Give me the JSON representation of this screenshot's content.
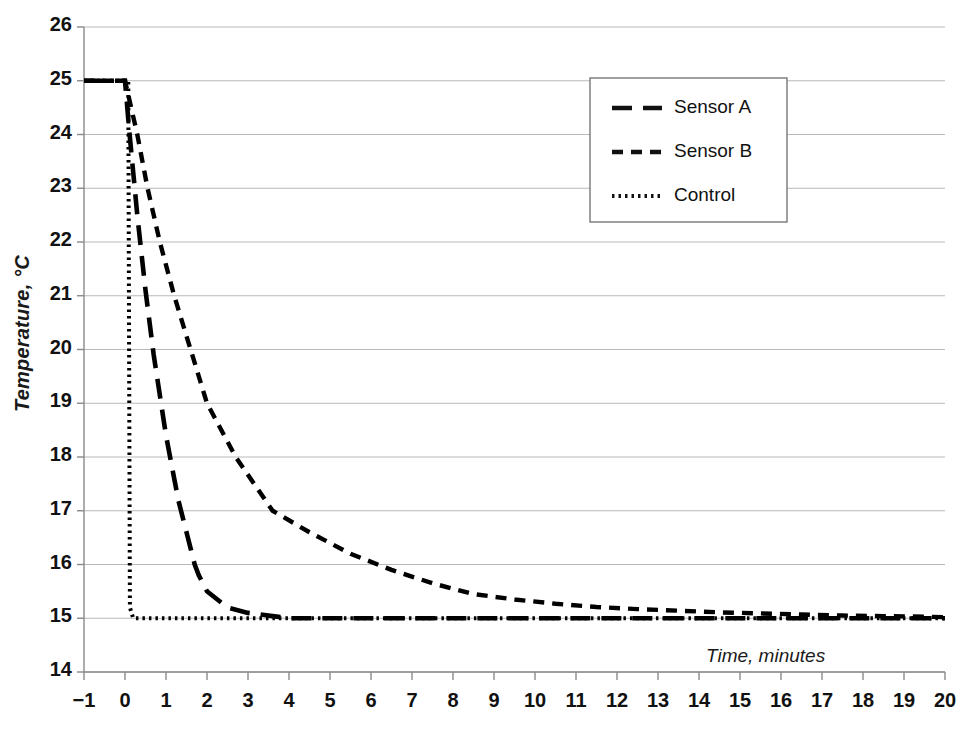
{
  "chart_data": {
    "type": "line",
    "title": "",
    "xlabel": "Time, minutes",
    "ylabel": "Temperature, °C",
    "xlim": [
      -1,
      20
    ],
    "ylim": [
      14,
      26
    ],
    "xticks": [
      "−1",
      "0",
      "1",
      "2",
      "3",
      "4",
      "5",
      "6",
      "7",
      "8",
      "9",
      "10",
      "11",
      "12",
      "13",
      "14",
      "15",
      "16",
      "17",
      "18",
      "19",
      "20"
    ],
    "yticks": [
      "26",
      "25",
      "24",
      "23",
      "22",
      "21",
      "20",
      "19",
      "18",
      "17",
      "16",
      "15",
      "14"
    ],
    "grid": "horizontal",
    "legend_position": "upper-center-right",
    "series": [
      {
        "name": "Sensor A",
        "dash": "long-dash",
        "color": "#000000",
        "x": [
          -1,
          -0.5,
          0,
          0.1,
          0.2,
          0.3,
          0.4,
          0.5,
          0.6,
          0.7,
          0.8,
          0.9,
          1.0,
          1.1,
          1.2,
          1.3,
          1.4,
          1.5,
          1.6,
          1.7,
          1.8,
          2.0,
          2.5,
          3,
          4,
          5,
          6,
          7,
          8,
          9,
          10,
          11,
          12,
          13,
          14,
          15,
          16,
          17,
          18,
          19,
          20
        ],
        "y": [
          25,
          25,
          25,
          24.1,
          23.3,
          22.5,
          21.8,
          21.1,
          20.5,
          19.9,
          19.4,
          18.9,
          18.4,
          18.0,
          17.6,
          17.2,
          16.9,
          16.6,
          16.3,
          16.0,
          15.8,
          15.5,
          15.2,
          15.1,
          15.0,
          15.0,
          15.0,
          15.0,
          15.0,
          15.0,
          15.0,
          15.0,
          15.0,
          15.0,
          15.0,
          15.0,
          15.0,
          15.0,
          15.0,
          15.0,
          15.0
        ]
      },
      {
        "name": "Sensor B",
        "dash": "medium-dash",
        "color": "#000000",
        "x": [
          -1,
          -0.5,
          0,
          0.3,
          0.55,
          0.85,
          1.2,
          1.6,
          2.0,
          2.7,
          3.6,
          4.5,
          5.5,
          6.5,
          7.5,
          8.5,
          9.5,
          10.5,
          11.5,
          12.5,
          13.5,
          14.5,
          15.5,
          16.5,
          17.5,
          18.5,
          19.5,
          20
        ],
        "y": [
          25,
          25,
          25,
          24.0,
          23.0,
          22.0,
          21.0,
          20.0,
          19.0,
          18.0,
          17.0,
          16.6,
          16.2,
          15.9,
          15.65,
          15.45,
          15.35,
          15.27,
          15.21,
          15.17,
          15.14,
          15.11,
          15.09,
          15.07,
          15.05,
          15.04,
          15.03,
          15.02
        ]
      },
      {
        "name": "Control",
        "dash": "dotted",
        "color": "#000000",
        "x": [
          -1,
          -0.5,
          0,
          0.08,
          0.1,
          0.12,
          0.2,
          1,
          2,
          4,
          6,
          8,
          10,
          12,
          14,
          16,
          18,
          20
        ],
        "y": [
          25,
          25,
          25,
          25,
          20,
          15.2,
          15,
          15,
          15,
          15,
          15,
          15,
          15,
          15,
          15,
          15,
          15,
          15
        ]
      }
    ]
  },
  "legend": {
    "items": [
      {
        "label": "Sensor A",
        "dash": "long-dash"
      },
      {
        "label": "Sensor B",
        "dash": "medium-dash"
      },
      {
        "label": "Control",
        "dash": "dotted"
      }
    ]
  },
  "style": {
    "gridline_color": "#b9b9b9",
    "axis_color": "#8a8a8a",
    "series_color": "#111111",
    "background": "#ffffff"
  }
}
